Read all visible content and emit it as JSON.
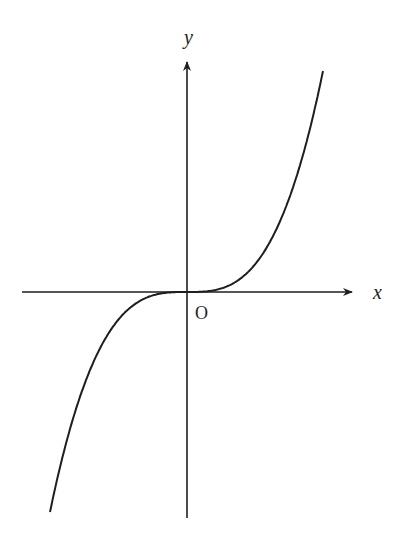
{
  "chart_data": {
    "type": "line",
    "title": "",
    "xlabel": "x",
    "ylabel": "y",
    "origin_label": "O",
    "function": "y = k·x^3 (cubic through origin, increasing)",
    "grid": false,
    "legend": null,
    "series": [
      {
        "name": "cubic curve",
        "x": [
          -1.0,
          -0.75,
          -0.5,
          -0.25,
          0,
          0.25,
          0.5,
          0.75,
          1.0
        ],
        "y": [
          -1.0,
          -0.42,
          -0.125,
          -0.016,
          0,
          0.016,
          0.125,
          0.42,
          1.0
        ]
      }
    ],
    "xlim": [
      -1.2,
      1.2
    ],
    "ylim": [
      -1.05,
      1.0
    ],
    "colors": {
      "axis": "#1e1e1e",
      "curve": "#1e1e1e",
      "background": "#ffffff"
    }
  },
  "labels": {
    "x_axis": "x",
    "y_axis": "y",
    "origin": "O"
  }
}
